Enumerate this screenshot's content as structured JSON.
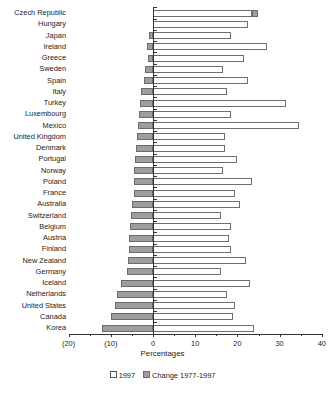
{
  "chart_data": {
    "type": "bar",
    "orientation": "horizontal",
    "stacked": false,
    "title": "",
    "xlabel": "Percentages",
    "ylabel": "",
    "xlim": [
      -20,
      40
    ],
    "xticks": [
      -20,
      -10,
      0,
      10,
      20,
      30,
      40
    ],
    "xticklabels": [
      "(20)",
      "(10)",
      "0",
      "10",
      "20",
      "30",
      "40"
    ],
    "grid": false,
    "legend_position": "bottom",
    "categories": [
      "Czech Republic",
      "Hungary",
      "Japan",
      "Ireland",
      "Greece",
      "Sweden",
      "Spain",
      "Italy",
      "Turkey",
      "Luxembourg",
      "Mexico",
      "United Kingdom",
      "Denmark",
      "Portugal",
      "Norway",
      "Poland",
      "France",
      "Australia",
      "Switzerland",
      "Belgium",
      "Austria",
      "Finland",
      "New Zealand",
      "Germany",
      "Iceland",
      "Netherlands",
      "United States",
      "Canada",
      "Korea"
    ],
    "series": [
      {
        "name": "1997",
        "color": "#ffffff",
        "values": [
          23.5,
          22.5,
          18.5,
          27.0,
          21.5,
          16.5,
          22.5,
          17.5,
          31.5,
          18.5,
          34.5,
          17.0,
          17.0,
          20.0,
          16.5,
          23.5,
          19.5,
          20.5,
          16.0,
          18.5,
          18.0,
          18.5,
          22.0,
          16.0,
          23.0,
          17.5,
          19.5,
          19.0,
          24.0
        ]
      },
      {
        "name": "Change 1977-1997",
        "color": "#9e9e9e",
        "values": [
          1.5,
          0.0,
          -1.0,
          -1.5,
          -1.2,
          -2.0,
          -2.2,
          -2.8,
          -3.0,
          -3.2,
          -3.5,
          -3.8,
          -4.0,
          -4.2,
          -4.4,
          -4.5,
          -4.6,
          -5.0,
          -5.2,
          -5.4,
          -5.6,
          -5.8,
          -6.0,
          -6.2,
          -7.5,
          -8.5,
          -9.0,
          -10.0,
          -12.0
        ]
      }
    ]
  },
  "legend": {
    "entries": [
      {
        "swatch": "white-square",
        "label": "1997"
      },
      {
        "swatch": "gray-square",
        "label": "Change  1977-1997"
      }
    ]
  }
}
